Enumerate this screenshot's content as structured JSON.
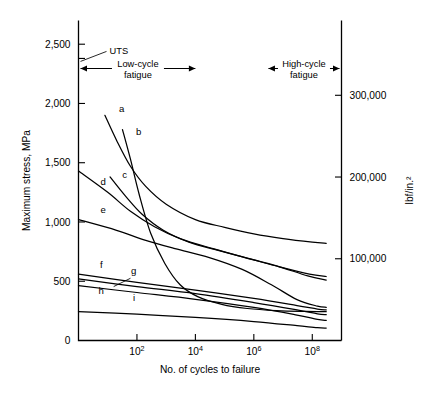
{
  "chart_data": {
    "type": "line",
    "title": "",
    "subtitle": "",
    "xlabel": "No. of cycles to failure",
    "ylabel": "Maximum stress, MPa",
    "y2label": "lbf/in.²",
    "xscale": "log",
    "xlim": [
      1,
      1000000000
    ],
    "ylim": [
      0,
      2700
    ],
    "y2lim": [
      0,
      391500
    ],
    "grid": false,
    "legend_position": "inline-curve-labels",
    "xticks": [
      {
        "value": 100,
        "label_base": "10",
        "label_exp": "2"
      },
      {
        "value": 10000,
        "label_base": "10",
        "label_exp": "4"
      },
      {
        "value": 1000000,
        "label_base": "10",
        "label_exp": "6"
      },
      {
        "value": 100000000,
        "label_base": "10",
        "label_exp": "8"
      }
    ],
    "yticks": [
      {
        "value": 0,
        "label": "0"
      },
      {
        "value": 500,
        "label": "500"
      },
      {
        "value": 1000,
        "label": "1,000"
      },
      {
        "value": 1500,
        "label": "1,500"
      },
      {
        "value": 2000,
        "label": "2,000"
      },
      {
        "value": 2500,
        "label": "2,500"
      }
    ],
    "y2ticks": [
      {
        "value": 100000,
        "label": "100,000"
      },
      {
        "value": 200000,
        "label": "200,000"
      },
      {
        "value": 300000,
        "label": "300,000"
      }
    ],
    "annotations": [
      {
        "name": "uts-marker",
        "label": "UTS",
        "y_value": 2380,
        "note": "tick on left axis just below 2,500 with leader line to text"
      },
      {
        "name": "low-cycle-fatigue-range",
        "label_line1": "Low-cycle",
        "label_line2": "fatigue",
        "x_from": 1,
        "x_to": 10000
      },
      {
        "name": "high-cycle-fatigue-range",
        "label_line1": "High-cycle",
        "label_line2": "fatigue",
        "x_from": 3160000,
        "x_to": 1000000000
      }
    ],
    "series": [
      {
        "name": "a",
        "label": "a",
        "label_x": 30,
        "label_y": 1930,
        "points": [
          [
            8,
            1900
          ],
          [
            20,
            1690
          ],
          [
            60,
            1470
          ],
          [
            200,
            1300
          ],
          [
            1000,
            1150
          ],
          [
            10000,
            1020
          ],
          [
            100000,
            955
          ],
          [
            1000000,
            900
          ],
          [
            10000000,
            860
          ],
          [
            100000000,
            830
          ],
          [
            300000000,
            820
          ]
        ]
      },
      {
        "name": "b",
        "label": "b",
        "label_x": 115,
        "label_y": 1730,
        "points": [
          [
            32,
            1780
          ],
          [
            60,
            1530
          ],
          [
            120,
            1230
          ],
          [
            300,
            900
          ],
          [
            900,
            650
          ],
          [
            3000,
            470
          ],
          [
            12000,
            370
          ],
          [
            80000,
            305
          ],
          [
            600000,
            270
          ],
          [
            6000000,
            252
          ],
          [
            60000000,
            245
          ],
          [
            300000000,
            243
          ]
        ]
      },
      {
        "name": "c",
        "label": "c",
        "label_x": 38,
        "label_y": 1370,
        "points": [
          [
            12,
            1380
          ],
          [
            40,
            1220
          ],
          [
            150,
            1065
          ],
          [
            800,
            930
          ],
          [
            6000,
            830
          ],
          [
            60000,
            760
          ],
          [
            700000,
            690
          ],
          [
            8000000,
            620
          ],
          [
            80000000,
            560
          ],
          [
            300000000,
            540
          ]
        ]
      },
      {
        "name": "d",
        "label": "d",
        "label_x": 7,
        "label_y": 1310,
        "points": [
          [
            1,
            1430
          ],
          [
            10,
            1250
          ],
          [
            60,
            1090
          ],
          [
            400,
            960
          ],
          [
            3000,
            860
          ],
          [
            40000,
            775
          ],
          [
            500000,
            700
          ],
          [
            6000000,
            630
          ],
          [
            70000000,
            545
          ],
          [
            300000000,
            510
          ]
        ]
      },
      {
        "name": "e",
        "label": "e",
        "label_x": 7,
        "label_y": 1075,
        "points": [
          [
            1,
            1020
          ],
          [
            20,
            930
          ],
          [
            200,
            845
          ],
          [
            2000,
            775
          ],
          [
            30000,
            700
          ],
          [
            400000,
            600
          ],
          [
            4000000,
            470
          ],
          [
            30000000,
            345
          ],
          [
            150000000,
            290
          ],
          [
            300000000,
            280
          ]
        ]
      },
      {
        "name": "f",
        "label": "f",
        "label_x": 6,
        "label_y": 610,
        "points": [
          [
            1,
            560
          ],
          [
            100,
            490
          ],
          [
            10000,
            425
          ],
          [
            1000000,
            355
          ],
          [
            30000000,
            295
          ],
          [
            150000000,
            265
          ],
          [
            300000000,
            258
          ]
        ]
      },
      {
        "name": "g",
        "label": "g",
        "label_x": 78,
        "label_y": 560,
        "leader_from": [
          60,
          525
        ],
        "leader_to": [
          16,
          455
        ],
        "points": [
          [
            1,
            520
          ],
          [
            100,
            455
          ],
          [
            10000,
            395
          ],
          [
            1000000,
            320
          ],
          [
            30000000,
            258
          ],
          [
            150000000,
            225
          ],
          [
            300000000,
            218
          ]
        ]
      },
      {
        "name": "h",
        "label": "h",
        "label_x": 6,
        "label_y": 390,
        "points": [
          [
            1,
            462
          ],
          [
            100,
            405
          ],
          [
            10000,
            348
          ],
          [
            1000000,
            280
          ],
          [
            30000000,
            215
          ],
          [
            150000000,
            178
          ],
          [
            300000000,
            170
          ]
        ]
      },
      {
        "name": "i",
        "label": "i",
        "label_x": 80,
        "label_y": 330,
        "points": [
          [
            1,
            243
          ],
          [
            100,
            222
          ],
          [
            10000,
            195
          ],
          [
            1000000,
            160
          ],
          [
            30000000,
            125
          ],
          [
            150000000,
            108
          ],
          [
            300000000,
            105
          ]
        ]
      }
    ]
  }
}
